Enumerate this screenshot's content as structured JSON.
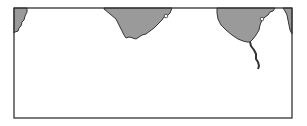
{
  "map": {
    "frame": {
      "x": 14,
      "y": 8,
      "width": 278,
      "height": 110,
      "stroke": "#333333"
    },
    "colors": {
      "land": "#9a9a9a",
      "water": "#ffffff",
      "coast": "#333333"
    },
    "landmasses": [
      {
        "name": "landmass-left",
        "points": "14,8 27,8 27,12 25,16 24,20 22,22 21,26 19,28 18,31 15,32 14,33"
      },
      {
        "name": "landmass-center",
        "points": "104,8 172,8 170,13 167,16 164,17 162,20 158,24 154,28 150,31 146,34 142,35 139,37 136,39 133,38 129,37 126,38 124,35 122,31 119,25 116,19 110,14 104,9"
      },
      {
        "name": "landmass-right",
        "points": "217,8 275,8 273,11 270,12 268,15 265,17 262,20 260,25 259,30 256,35 253,39 250,42 247,42 243,41 238,39 232,35 226,30 221,25 218,19 217,13"
      },
      {
        "name": "landmass-far-right",
        "points": "283,8 292,8 292,34 290,30 289,25 288,20 287,15 285,11"
      }
    ],
    "rivers": [
      {
        "name": "river",
        "points": "250,42 251,46 254,50 256,54 256,59 258,62 259,66 258,69"
      }
    ],
    "markers": [
      {
        "name": "city-marker-center",
        "cx": 166,
        "cy": 16,
        "r": 1.8
      },
      {
        "name": "city-marker-right",
        "cx": 262,
        "cy": 19,
        "r": 1.8
      }
    ]
  }
}
